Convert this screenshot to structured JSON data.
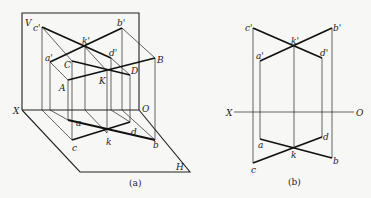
{
  "figure": {
    "panel_a": {
      "caption": "(a)",
      "planes": {
        "V": "V",
        "H": "H"
      },
      "axis": {
        "X": "X",
        "O": "O"
      },
      "space_points": {
        "A": "A",
        "B": "B",
        "C": "C",
        "D": "D",
        "K": "K"
      },
      "front_projections": {
        "a": "a'",
        "b": "b'",
        "c": "c'",
        "d": "d'",
        "k": "k'"
      },
      "top_projections": {
        "a": "a",
        "b": "b",
        "c": "c",
        "d": "d",
        "k": "k"
      }
    },
    "panel_b": {
      "caption": "(b)",
      "axis": {
        "X": "X",
        "O": "O"
      },
      "front_projections": {
        "a": "a'",
        "b": "b'",
        "c": "c'",
        "d": "d'",
        "k": "k'"
      },
      "top_projections": {
        "a": "a",
        "b": "b",
        "c": "c",
        "d": "d",
        "k": "k"
      }
    },
    "colors": {
      "line": "#222222",
      "background": "#f7f7f5"
    }
  }
}
